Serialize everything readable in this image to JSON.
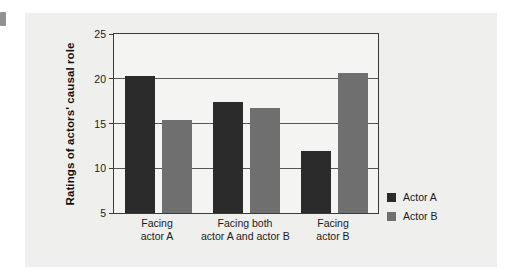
{
  "chart_data": {
    "type": "bar",
    "title": "",
    "subtitle": "",
    "xlabel": "",
    "ylabel": "Ratings of actors' causal role",
    "categories": [
      "Facing\nactor A",
      "Facing both\nactor A and actor B",
      "Facing\nactor B"
    ],
    "category_lines": [
      [
        "Facing",
        "actor A"
      ],
      [
        "Facing both",
        "actor A and actor B"
      ],
      [
        "Facing",
        "actor B"
      ]
    ],
    "series": [
      {
        "name": "Actor A",
        "color": "#2b2b2b",
        "values": [
          20.3,
          17.4,
          11.9
        ]
      },
      {
        "name": "Actor B",
        "color": "#6f6f6f",
        "values": [
          15.4,
          16.7,
          20.7
        ]
      }
    ],
    "ylim": [
      5,
      25
    ],
    "yticks": [
      5,
      10,
      15,
      20,
      25
    ],
    "ytick_labels": [
      "5",
      "10",
      "15",
      "20",
      "25"
    ],
    "grid": true,
    "grid_axis": "y",
    "legend_position": "right-bottom",
    "plot_background": "#f4f4f2",
    "figure_background": "#efefed",
    "axis_color": "#3a3a3a"
  },
  "legend": {
    "entries": [
      {
        "label": "Actor A"
      },
      {
        "label": "Actor B"
      }
    ]
  }
}
